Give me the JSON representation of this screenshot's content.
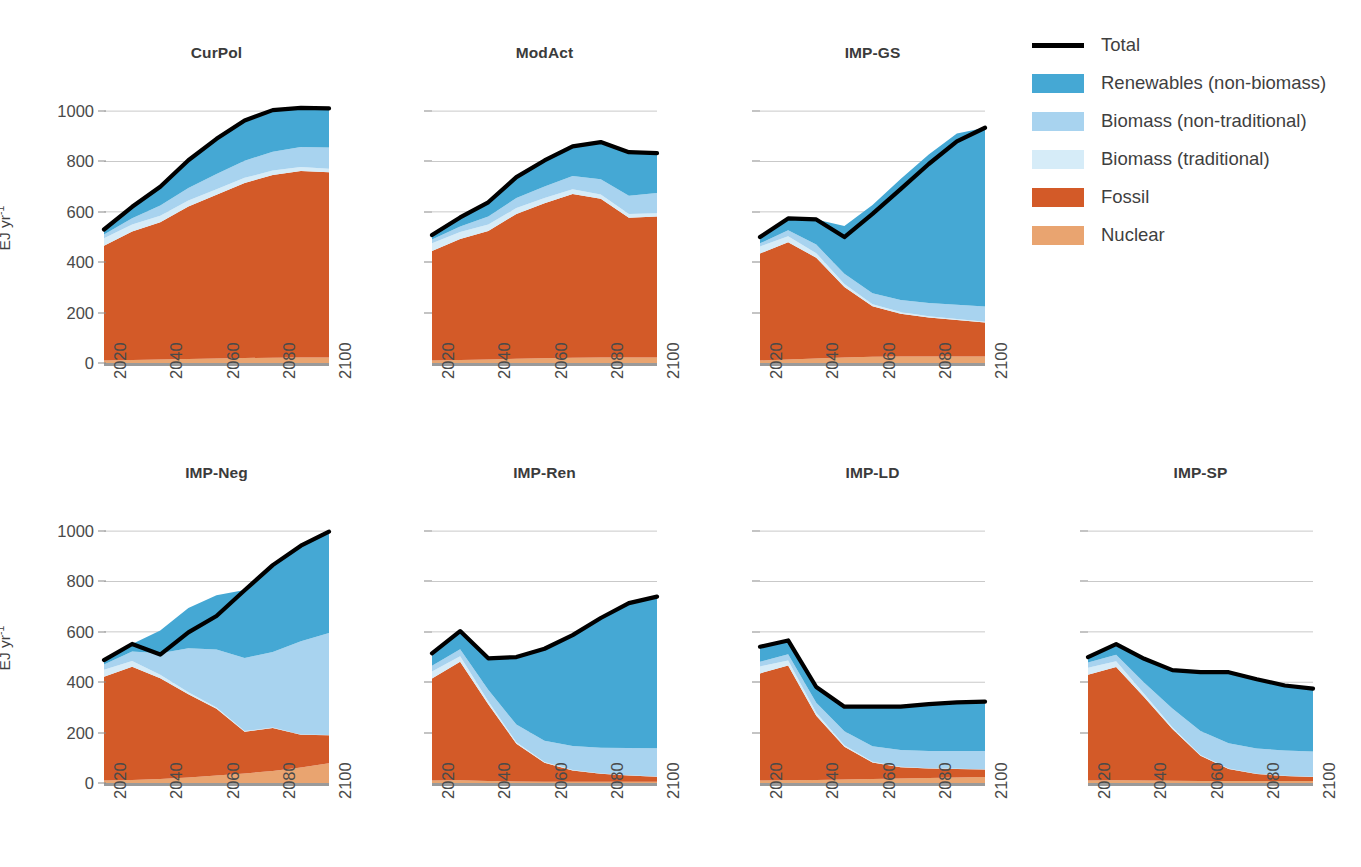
{
  "figure": {
    "y_axis_title": "EJ yr",
    "y_axis_title_exponent": "-1",
    "y_ticks": [
      0,
      200,
      400,
      600,
      800,
      1000
    ],
    "x_ticks": [
      2020,
      2040,
      2060,
      2080,
      2100
    ]
  },
  "legend": {
    "items": [
      {
        "label": "Total",
        "color": "#000000",
        "style": "line"
      },
      {
        "label": "Renewables (non-biomass)",
        "color": "#45a8d4",
        "style": "swatch"
      },
      {
        "label": "Biomass (non-traditional)",
        "color": "#a8d3ef",
        "style": "swatch"
      },
      {
        "label": "Biomass (traditional)",
        "color": "#d6ecf8",
        "style": "swatch"
      },
      {
        "label": "Fossil",
        "color": "#d35a28",
        "style": "swatch"
      },
      {
        "label": "Nuclear",
        "color": "#e9a470",
        "style": "swatch"
      }
    ]
  },
  "chart_data": {
    "type": "area",
    "xlabel": "",
    "ylabel": "EJ yr-1",
    "ylim": [
      0,
      1060
    ],
    "xlim": [
      2020,
      2100
    ],
    "grid": "horizontal",
    "legend_position": "right",
    "stack_order": [
      "Nuclear",
      "Fossil",
      "Biomass (traditional)",
      "Biomass (non-traditional)",
      "Renewables (non-biomass)"
    ],
    "series_colors": {
      "Nuclear": "#e9a470",
      "Fossil": "#d35a28",
      "Biomass (traditional)": "#d6ecf8",
      "Biomass (non-traditional)": "#a8d3ef",
      "Renewables (non-biomass)": "#45a8d4",
      "Total": "#000000"
    },
    "x": [
      2020,
      2030,
      2040,
      2050,
      2060,
      2070,
      2080,
      2090,
      2100
    ],
    "panels": [
      {
        "name": "CurPol",
        "row": 0,
        "col": 0,
        "series": [
          {
            "name": "Nuclear",
            "values": [
              10,
              12,
              14,
              16,
              18,
              20,
              21,
              22,
              22
            ]
          },
          {
            "name": "Fossil",
            "values": [
              455,
              510,
              545,
              605,
              650,
              695,
              725,
              740,
              735
            ]
          },
          {
            "name": "Biomass (traditional)",
            "values": [
              30,
              28,
              26,
              24,
              22,
              20,
              18,
              16,
              14
            ]
          },
          {
            "name": "Biomass (non-traditional)",
            "values": [
              15,
              25,
              40,
              50,
              60,
              68,
              75,
              80,
              85
            ]
          },
          {
            "name": "Renewables (non-biomass)",
            "values": [
              25,
              45,
              75,
              110,
              140,
              160,
              165,
              155,
              155
            ]
          }
        ],
        "total": [
          530,
          620,
          700,
          805,
          890,
          963,
          1004,
          1013,
          1011
        ]
      },
      {
        "name": "ModAct",
        "row": 0,
        "col": 1,
        "series": [
          {
            "name": "Nuclear",
            "values": [
              10,
              12,
              14,
              17,
              19,
              21,
              22,
              22,
              22
            ]
          },
          {
            "name": "Fossil",
            "values": [
              435,
              480,
              510,
              575,
              615,
              650,
              630,
              555,
              560
            ]
          },
          {
            "name": "Biomass (traditional)",
            "values": [
              30,
              28,
              26,
              23,
              21,
              19,
              17,
              15,
              13
            ]
          },
          {
            "name": "Biomass (non-traditional)",
            "values": [
              15,
              22,
              32,
              40,
              46,
              52,
              60,
              72,
              80
            ]
          },
          {
            "name": "Renewables (non-biomass)",
            "values": [
              22,
              38,
              58,
              85,
              105,
              120,
              150,
              175,
              160
            ]
          }
        ],
        "total": [
          508,
          578,
          638,
          738,
          804,
          860,
          877,
          837,
          833
        ]
      },
      {
        "name": "IMP-GS",
        "row": 0,
        "col": 2,
        "series": [
          {
            "name": "Nuclear",
            "values": [
              10,
              14,
              18,
              22,
              25,
              26,
              26,
              26,
              26
            ]
          },
          {
            "name": "Fossil",
            "values": [
              425,
              465,
              400,
              280,
              200,
              170,
              155,
              145,
              135
            ]
          },
          {
            "name": "Biomass (traditional)",
            "values": [
              28,
              24,
              18,
              12,
              8,
              6,
              5,
              4,
              3
            ]
          },
          {
            "name": "Biomass (non-traditional)",
            "values": [
              12,
              24,
              34,
              40,
              44,
              48,
              52,
              56,
              60
            ]
          },
          {
            "name": "Renewables (non-biomass)",
            "values": [
              25,
              47,
              100,
              190,
              350,
              480,
              590,
              680,
              710
            ]
          }
        ],
        "total": [
          500,
          574,
          570,
          500,
          592,
          690,
          790,
          880,
          934
        ]
      },
      {
        "name": "IMP-Neg",
        "row": 1,
        "col": 0,
        "series": [
          {
            "name": "Nuclear",
            "values": [
              10,
              12,
              16,
              22,
              30,
              38,
              48,
              62,
              78
            ]
          },
          {
            "name": "Fossil",
            "values": [
              412,
              450,
              400,
              330,
              265,
              165,
              170,
              130,
              112
            ]
          },
          {
            "name": "Biomass (traditional)",
            "values": [
              28,
              22,
              14,
              8,
              5,
              3,
              2,
              1,
              1
            ]
          },
          {
            "name": "Biomass (non-traditional)",
            "values": [
              20,
              38,
              85,
              175,
              230,
              290,
              300,
              370,
              405
            ]
          },
          {
            "name": "Renewables (non-biomass)",
            "values": [
              18,
              30,
              90,
              160,
              215,
              270,
              345,
              380,
              402
            ]
          }
        ],
        "total": [
          488,
          552,
          510,
          598,
          663,
          765,
          865,
          942,
          998
        ]
      },
      {
        "name": "IMP-Ren",
        "row": 1,
        "col": 1,
        "series": [
          {
            "name": "Nuclear",
            "values": [
              10,
              11,
              8,
              6,
              5,
              5,
              5,
              5,
              5
            ]
          },
          {
            "name": "Fossil",
            "values": [
              405,
              470,
              305,
              150,
              75,
              45,
              32,
              25,
              20
            ]
          },
          {
            "name": "Biomass (traditional)",
            "values": [
              28,
              22,
              12,
              6,
              3,
              2,
              1,
              1,
              1
            ]
          },
          {
            "name": "Biomass (non-traditional)",
            "values": [
              22,
              28,
              45,
              70,
              85,
              95,
              102,
              108,
              112
            ]
          },
          {
            "name": "Renewables (non-biomass)",
            "values": [
              50,
              72,
              125,
              268,
              365,
              440,
              515,
              575,
              602
            ]
          }
        ],
        "total": [
          515,
          603,
          495,
          500,
          533,
          587,
          655,
          714,
          740
        ]
      },
      {
        "name": "IMP-LD",
        "row": 1,
        "col": 2,
        "series": [
          {
            "name": "Nuclear",
            "values": [
              10,
              11,
              12,
              14,
              16,
              18,
              20,
              22,
              24
            ]
          },
          {
            "name": "Fossil",
            "values": [
              425,
              455,
              255,
              130,
              65,
              45,
              38,
              34,
              30
            ]
          },
          {
            "name": "Biomass (traditional)",
            "values": [
              28,
              20,
              12,
              6,
              3,
              2,
              1,
              1,
              1
            ]
          },
          {
            "name": "Biomass (non-traditional)",
            "values": [
              18,
              25,
              40,
              55,
              62,
              66,
              68,
              70,
              72
            ]
          },
          {
            "name": "Renewables (non-biomass)",
            "values": [
              60,
              55,
              62,
              98,
              157,
              172,
              186,
              193,
              196
            ]
          }
        ],
        "total": [
          541,
          566,
          381,
          303,
          303,
          303,
          313,
          320,
          323
        ]
      },
      {
        "name": "IMP-SP",
        "row": 1,
        "col": 3,
        "series": [
          {
            "name": "Nuclear",
            "values": [
              10,
              11,
              10,
              9,
              8,
              8,
              8,
              8,
              8
            ]
          },
          {
            "name": "Fossil",
            "values": [
              420,
              450,
              330,
              205,
              100,
              48,
              28,
              20,
              16
            ]
          },
          {
            "name": "Biomass (traditional)",
            "values": [
              28,
              22,
              13,
              7,
              3,
              2,
              1,
              1,
              1
            ]
          },
          {
            "name": "Biomass (non-traditional)",
            "values": [
              20,
              26,
              45,
              75,
              95,
              100,
              100,
              100,
              100
            ]
          },
          {
            "name": "Renewables (non-biomass)",
            "values": [
              22,
              42,
              95,
              152,
              234,
              282,
              275,
              258,
              250
            ]
          }
        ],
        "total": [
          500,
          551,
          493,
          448,
          440,
          440,
          412,
          387,
          375
        ]
      }
    ]
  }
}
